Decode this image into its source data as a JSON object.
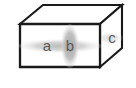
{
  "figure": {
    "name": "rectangular-box-dimension-diagram",
    "type": "diagram",
    "background_color": "#ffffff",
    "edge_color": "#1a1a1a",
    "face_fill_color": "#ffffff",
    "shade_color": "#c8c8c8",
    "label_color": "#5a5a5a",
    "labels": [
      {
        "id": "label-a",
        "text": "a",
        "position": "front-face-left",
        "meaning": "width",
        "highlight_shape": "horizontal-lens",
        "x": 47,
        "y": 48
      },
      {
        "id": "label-b",
        "text": "b",
        "position": "front-face-center",
        "meaning": "height",
        "highlight_shape": "vertical-lens",
        "x": 70,
        "y": 48
      },
      {
        "id": "label-c",
        "text": "c",
        "position": "right-side-face",
        "meaning": "depth",
        "highlight_shape": "faint-lens",
        "x": 112,
        "y": 40
      }
    ],
    "geometry": {
      "front_face": {
        "top_left": [
          20,
          24
        ],
        "top_right": [
          100,
          24
        ],
        "bottom_right": [
          100,
          67
        ],
        "bottom_left": [
          20,
          67
        ]
      },
      "top_back_left": [
        43,
        5
      ],
      "top_back_right": [
        122,
        5
      ],
      "right_back_bottom": [
        122,
        48
      ]
    }
  }
}
